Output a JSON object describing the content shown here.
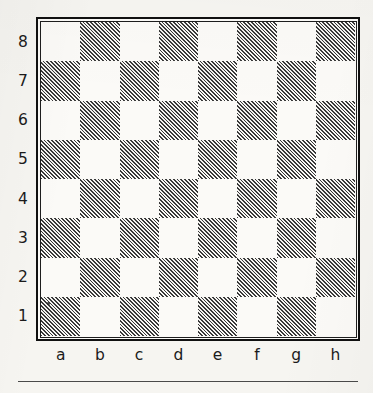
{
  "diagram": {
    "kind": "chessboard-coordinate-diagram",
    "caption_rule_present": true,
    "rank_labels": [
      "8",
      "7",
      "6",
      "5",
      "4",
      "3",
      "2",
      "1"
    ],
    "file_labels": [
      "a",
      "b",
      "c",
      "d",
      "e",
      "f",
      "g",
      "h"
    ],
    "colors": {
      "paper": "#f6f5f1",
      "light_square": "#fbfaf7",
      "hatch_ink": "#3a3a3a",
      "frame": "#101010",
      "label_text": "#1b1b1b",
      "rule": "#4a4a4a"
    }
  },
  "chart_data": {
    "type": "heatmap",
    "title": "",
    "subtitle": "",
    "xlabel": "",
    "ylabel": "",
    "grid": true,
    "legend_position": "none",
    "x": [
      "a",
      "b",
      "c",
      "d",
      "e",
      "f",
      "g",
      "h"
    ],
    "y": [
      "8",
      "7",
      "6",
      "5",
      "4",
      "3",
      "2",
      "1"
    ],
    "value_labels": {
      "0": "light",
      "1": "dark-hatched"
    },
    "rows": [
      {
        "rank": "8",
        "values": [
          0,
          1,
          0,
          1,
          0,
          1,
          0,
          1
        ]
      },
      {
        "rank": "7",
        "values": [
          1,
          0,
          1,
          0,
          1,
          0,
          1,
          0
        ]
      },
      {
        "rank": "6",
        "values": [
          0,
          1,
          0,
          1,
          0,
          1,
          0,
          1
        ]
      },
      {
        "rank": "5",
        "values": [
          1,
          0,
          1,
          0,
          1,
          0,
          1,
          0
        ]
      },
      {
        "rank": "4",
        "values": [
          0,
          1,
          0,
          1,
          0,
          1,
          0,
          1
        ]
      },
      {
        "rank": "3",
        "values": [
          1,
          0,
          1,
          0,
          1,
          0,
          1,
          0
        ]
      },
      {
        "rank": "2",
        "values": [
          0,
          1,
          0,
          1,
          0,
          1,
          0,
          1
        ]
      },
      {
        "rank": "1",
        "values": [
          1,
          0,
          1,
          0,
          1,
          0,
          1,
          0
        ]
      }
    ]
  }
}
